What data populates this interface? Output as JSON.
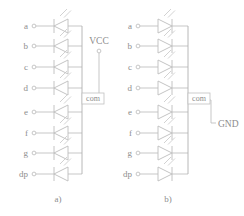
{
  "figure": {
    "type": "circuit-schematic",
    "width": 244,
    "height": 216,
    "colors": {
      "wire": "#b9b9b9",
      "symbol": "#bdbdbd",
      "text": "#8d8d8d",
      "background": "#ffffff"
    }
  },
  "pin_labels": [
    "a",
    "b",
    "c",
    "d",
    "e",
    "f",
    "g",
    "dp"
  ],
  "diagrams": [
    {
      "id": "a",
      "caption": "a)",
      "kind": "common-anode",
      "led_direction": "left",
      "pins": [
        "a",
        "b",
        "c",
        "d",
        "e",
        "f",
        "g",
        "dp"
      ],
      "common_label": "com",
      "rail_label": "VCC",
      "rail_terminal": "circle"
    },
    {
      "id": "b",
      "caption": "b)",
      "kind": "common-cathode",
      "led_direction": "right",
      "pins": [
        "a",
        "b",
        "c",
        "d",
        "e",
        "f",
        "g",
        "dp"
      ],
      "common_label": "com",
      "rail_label": "GND",
      "rail_terminal": "tick"
    }
  ]
}
